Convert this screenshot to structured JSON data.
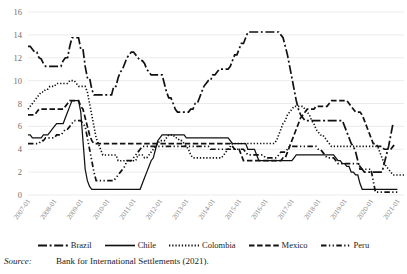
{
  "chart_data": {
    "type": "line",
    "title": "",
    "xlabel": "",
    "ylabel": "",
    "ylim": [
      0,
      16
    ],
    "ytick_step": 2,
    "yticks": [
      0,
      2,
      4,
      6,
      8,
      10,
      12,
      14,
      16
    ],
    "grid": true,
    "legend_position": "bottom",
    "x_tick_labels": [
      "2007-01",
      "2008-01",
      "2009-01",
      "2010-01",
      "2011-01",
      "2012-01",
      "2013-01",
      "2014-01",
      "2015-01",
      "2016-01",
      "2017-01",
      "2018-01",
      "2019-01",
      "2020-01",
      "2021-01"
    ],
    "x_start": "2007-01",
    "x_end": "2021-06",
    "x_frequency": "monthly",
    "series": [
      {
        "name": "Brazil",
        "dash": "long-dash-dot",
        "values": [
          13.0,
          13.0,
          12.75,
          12.5,
          12.5,
          12.0,
          11.9,
          11.5,
          11.25,
          11.25,
          11.25,
          11.25,
          11.25,
          11.25,
          11.25,
          11.25,
          11.75,
          12.0,
          12.0,
          13.0,
          13.75,
          13.75,
          13.75,
          13.75,
          12.75,
          12.75,
          11.25,
          10.25,
          10.25,
          9.25,
          8.75,
          8.75,
          8.75,
          8.75,
          8.75,
          8.75,
          8.75,
          8.75,
          8.75,
          9.5,
          9.5,
          10.25,
          10.75,
          11.0,
          11.5,
          12.0,
          12.25,
          12.5,
          12.5,
          12.25,
          12.0,
          11.75,
          11.75,
          11.5,
          11.0,
          10.75,
          10.5,
          10.5,
          10.5,
          10.5,
          10.5,
          10.5,
          9.75,
          9.0,
          8.5,
          8.5,
          8.0,
          7.5,
          7.25,
          7.25,
          7.25,
          7.25,
          7.25,
          7.25,
          7.5,
          7.5,
          8.0,
          8.0,
          8.5,
          9.0,
          9.5,
          9.75,
          10.0,
          10.0,
          10.5,
          10.5,
          10.75,
          11.0,
          11.0,
          11.0,
          11.0,
          11.0,
          11.25,
          11.75,
          12.25,
          12.25,
          12.75,
          13.25,
          13.25,
          13.75,
          14.25,
          14.25,
          14.25,
          14.25,
          14.25,
          14.25,
          14.25,
          14.25,
          14.25,
          14.25,
          14.25,
          14.25,
          14.25,
          14.25,
          14.25,
          14.0,
          13.75,
          13.0,
          12.25,
          11.25,
          10.25,
          9.25,
          8.25,
          7.5,
          7.0,
          6.75,
          6.5,
          6.5,
          6.5,
          6.5,
          6.5,
          6.5,
          6.5,
          6.5,
          6.5,
          6.5,
          6.5,
          6.5,
          6.5,
          6.5,
          6.5,
          6.5,
          6.5,
          6.5,
          6.0,
          5.5,
          5.0,
          4.5,
          4.25,
          3.75,
          3.0,
          2.25,
          2.25,
          2.0,
          2.0,
          2.0,
          2.0,
          2.0,
          2.0,
          2.0,
          2.0,
          2.0,
          2.75,
          3.5,
          4.25,
          5.25,
          6.25
        ],
        "endpoint_value": 6.25
      },
      {
        "name": "Chile",
        "dash": "solid",
        "values": [
          5.25,
          5.25,
          5.0,
          5.0,
          5.0,
          5.0,
          5.0,
          5.25,
          5.25,
          5.25,
          5.5,
          5.75,
          6.0,
          6.25,
          6.25,
          6.25,
          6.25,
          6.75,
          7.25,
          7.75,
          8.25,
          8.25,
          8.25,
          8.25,
          7.25,
          4.75,
          2.25,
          1.25,
          0.75,
          0.5,
          0.5,
          0.5,
          0.5,
          0.5,
          0.5,
          0.5,
          0.5,
          0.5,
          0.5,
          0.5,
          0.5,
          0.5,
          0.5,
          0.5,
          0.5,
          0.5,
          0.5,
          0.5,
          0.5,
          0.5,
          0.5,
          0.5,
          1.0,
          1.5,
          2.0,
          2.5,
          3.0,
          3.25,
          4.0,
          4.75,
          5.0,
          5.25,
          5.25,
          5.25,
          5.25,
          5.25,
          5.25,
          5.25,
          5.25,
          5.25,
          5.25,
          5.25,
          5.0,
          5.0,
          5.0,
          5.0,
          5.0,
          5.0,
          5.0,
          5.0,
          5.0,
          5.0,
          5.0,
          5.0,
          5.0,
          5.0,
          5.0,
          5.0,
          5.0,
          5.0,
          5.0,
          5.0,
          4.75,
          4.5,
          4.5,
          4.5,
          4.5,
          4.5,
          4.5,
          4.5,
          4.0,
          4.0,
          4.0,
          4.0,
          3.5,
          3.0,
          3.0,
          3.0,
          3.0,
          3.0,
          3.0,
          3.0,
          3.0,
          3.0,
          3.0,
          3.0,
          3.0,
          3.0,
          3.0,
          3.0,
          3.0,
          3.25,
          3.5,
          3.5,
          3.5,
          3.5,
          3.5,
          3.5,
          3.5,
          3.5,
          3.5,
          3.5,
          3.5,
          3.5,
          3.5,
          3.5,
          3.5,
          3.5,
          3.5,
          3.5,
          3.25,
          3.0,
          3.0,
          2.75,
          2.75,
          2.5,
          2.5,
          2.0,
          2.0,
          1.75,
          1.75,
          1.0,
          0.5,
          0.5,
          0.5,
          0.5,
          0.5,
          0.5,
          0.5,
          0.5,
          0.5,
          0.5,
          0.5,
          0.5,
          0.5,
          0.5,
          0.5,
          0.5,
          0.5
        ],
        "endpoint_value": 0.5
      },
      {
        "name": "Colombia",
        "dash": "dotted",
        "values": [
          7.5,
          7.75,
          8.0,
          8.25,
          8.5,
          8.75,
          9.0,
          9.0,
          9.25,
          9.25,
          9.5,
          9.5,
          9.5,
          9.75,
          9.75,
          9.75,
          9.75,
          9.75,
          9.75,
          10.0,
          10.0,
          10.0,
          9.75,
          9.5,
          9.5,
          9.5,
          9.5,
          9.0,
          8.0,
          7.0,
          6.0,
          5.0,
          4.5,
          4.0,
          3.5,
          3.5,
          3.5,
          3.5,
          3.5,
          3.5,
          3.5,
          3.0,
          3.0,
          3.0,
          3.0,
          3.0,
          3.0,
          3.0,
          3.0,
          3.0,
          3.5,
          3.5,
          3.5,
          3.25,
          3.25,
          3.5,
          3.75,
          4.0,
          4.25,
          4.5,
          4.75,
          4.75,
          4.75,
          5.0,
          5.25,
          5.25,
          5.25,
          5.0,
          5.0,
          4.75,
          4.75,
          4.5,
          4.25,
          4.0,
          3.5,
          3.25,
          3.25,
          3.25,
          3.25,
          3.25,
          3.25,
          3.25,
          3.25,
          3.25,
          3.25,
          3.25,
          3.25,
          3.25,
          3.25,
          3.5,
          3.75,
          4.0,
          4.25,
          4.5,
          4.5,
          4.5,
          4.5,
          4.5,
          4.5,
          4.5,
          4.5,
          4.5,
          4.5,
          4.5,
          4.5,
          4.5,
          4.5,
          4.5,
          4.5,
          4.5,
          4.5,
          4.5,
          4.5,
          4.75,
          5.25,
          5.75,
          6.25,
          6.5,
          7.0,
          7.25,
          7.5,
          7.75,
          7.75,
          7.75,
          7.75,
          7.75,
          7.5,
          7.25,
          7.0,
          6.5,
          6.25,
          5.75,
          5.5,
          5.25,
          5.25,
          5.0,
          4.75,
          4.5,
          4.25,
          4.25,
          4.25,
          4.25,
          4.25,
          4.25,
          4.25,
          4.25,
          4.25,
          4.25,
          4.25,
          4.25,
          4.25,
          4.25,
          4.25,
          4.25,
          4.25,
          4.25,
          4.25,
          4.25,
          4.25,
          4.25,
          3.75,
          3.25,
          2.75,
          2.5,
          2.25,
          2.0,
          1.75,
          1.75,
          1.75,
          1.75,
          1.75,
          1.75
        ],
        "endpoint_value": 1.75
      },
      {
        "name": "Mexico",
        "dash": "dashed",
        "values": [
          7.0,
          7.0,
          7.0,
          7.0,
          7.25,
          7.5,
          7.5,
          7.5,
          7.5,
          7.5,
          7.5,
          7.5,
          7.5,
          7.5,
          7.5,
          7.5,
          7.5,
          7.75,
          8.0,
          8.25,
          8.25,
          8.25,
          8.25,
          8.25,
          7.75,
          7.5,
          6.75,
          6.0,
          5.25,
          4.75,
          4.5,
          4.5,
          4.5,
          4.5,
          4.5,
          4.5,
          4.5,
          4.5,
          4.5,
          4.5,
          4.5,
          4.5,
          4.5,
          4.5,
          4.5,
          4.5,
          4.5,
          4.5,
          4.5,
          4.5,
          4.5,
          4.5,
          4.5,
          4.5,
          4.5,
          4.5,
          4.5,
          4.5,
          4.5,
          4.5,
          4.5,
          4.5,
          4.5,
          4.5,
          4.5,
          4.5,
          4.5,
          4.5,
          4.5,
          4.5,
          4.5,
          4.5,
          4.5,
          4.5,
          4.5,
          4.5,
          4.5,
          4.5,
          4.5,
          4.5,
          4.5,
          4.5,
          4.5,
          4.5,
          4.5,
          4.5,
          4.5,
          4.5,
          4.5,
          4.5,
          4.5,
          4.5,
          4.5,
          4.25,
          4.0,
          4.0,
          4.0,
          3.5,
          3.0,
          3.0,
          3.0,
          3.0,
          3.0,
          3.0,
          3.0,
          3.0,
          3.0,
          3.0,
          3.0,
          3.0,
          3.0,
          3.0,
          3.0,
          3.0,
          3.0,
          3.0,
          3.25,
          3.25,
          3.75,
          4.25,
          4.75,
          5.25,
          5.75,
          6.25,
          6.75,
          7.0,
          7.25,
          7.5,
          7.5,
          7.5,
          7.5,
          7.75,
          7.75,
          7.75,
          7.75,
          7.75,
          7.75,
          8.0,
          8.25,
          8.25,
          8.25,
          8.25,
          8.25,
          8.25,
          8.25,
          8.25,
          8.0,
          7.75,
          7.5,
          7.25,
          7.25,
          7.25,
          7.0,
          6.5,
          6.0,
          5.5,
          5.0,
          4.5,
          4.5,
          4.25,
          4.25,
          4.25,
          4.0,
          4.0,
          4.0,
          4.0,
          4.25,
          4.5
        ],
        "endpoint_value": 4.5
      },
      {
        "name": "Peru",
        "dash": "dash-dot-dot",
        "values": [
          4.5,
          4.5,
          4.5,
          4.5,
          4.5,
          4.5,
          4.75,
          4.75,
          5.0,
          5.0,
          5.0,
          5.0,
          5.0,
          5.25,
          5.25,
          5.25,
          5.5,
          5.75,
          5.75,
          6.0,
          6.25,
          6.5,
          6.5,
          6.5,
          6.5,
          6.25,
          6.0,
          5.0,
          4.0,
          3.0,
          2.0,
          1.25,
          1.25,
          1.25,
          1.25,
          1.25,
          1.25,
          1.25,
          1.25,
          1.25,
          1.5,
          1.75,
          2.0,
          2.25,
          2.5,
          3.0,
          3.0,
          3.0,
          3.25,
          3.5,
          3.75,
          4.0,
          4.25,
          4.25,
          4.25,
          4.25,
          4.25,
          4.25,
          4.25,
          4.25,
          4.25,
          4.25,
          4.25,
          4.25,
          4.25,
          4.25,
          4.25,
          4.25,
          4.25,
          4.25,
          4.25,
          4.25,
          4.25,
          4.25,
          4.25,
          4.25,
          4.25,
          4.25,
          4.25,
          4.25,
          4.25,
          4.25,
          4.25,
          4.0,
          4.0,
          4.0,
          4.0,
          4.0,
          4.0,
          4.0,
          4.0,
          4.0,
          4.0,
          4.0,
          4.0,
          4.0,
          4.0,
          4.0,
          4.0,
          3.75,
          3.5,
          3.5,
          3.5,
          3.5,
          3.5,
          3.5,
          3.5,
          3.5,
          3.25,
          3.25,
          3.25,
          3.25,
          3.25,
          3.25,
          3.5,
          3.75,
          3.75,
          3.75,
          4.0,
          4.25,
          4.25,
          4.25,
          4.25,
          4.25,
          4.25,
          4.25,
          4.25,
          4.25,
          4.25,
          4.25,
          4.25,
          4.25,
          4.0,
          4.0,
          3.75,
          3.5,
          3.25,
          3.25,
          3.25,
          3.25,
          3.0,
          2.75,
          2.75,
          2.75,
          2.75,
          2.75,
          2.75,
          2.75,
          2.75,
          2.75,
          2.75,
          2.5,
          2.25,
          2.25,
          2.25,
          2.25,
          2.25,
          1.25,
          0.25,
          0.25,
          0.25,
          0.25,
          0.25,
          0.25,
          0.25,
          0.25,
          0.25,
          0.25,
          0.25
        ],
        "endpoint_value": 0.25
      }
    ],
    "legend": [
      "Brazil",
      "Chile",
      "Colombia",
      "Mexico",
      "Peru"
    ]
  },
  "source": {
    "label": "Source:",
    "text": "Bank for International Settlements (2021)."
  },
  "colors": {
    "line": "#111111",
    "grid": "#e3e3e3",
    "axis_text": "#6f6f6f",
    "background": "#ffffff"
  }
}
